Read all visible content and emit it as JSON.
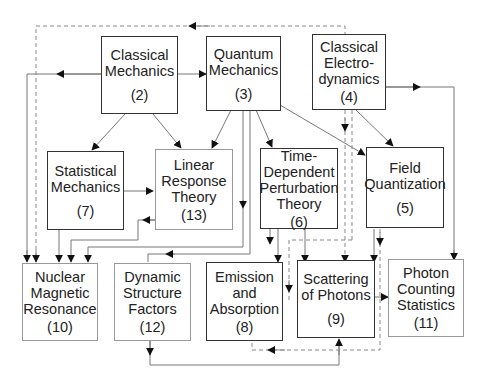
{
  "diagram": {
    "nodes": [
      {
        "id": 2,
        "label": "Classical\nMechanics",
        "number": "(2)"
      },
      {
        "id": 3,
        "label": "Quantum\nMechanics",
        "number": "(3)"
      },
      {
        "id": 4,
        "label": "Classical\nElectro-\ndynamics",
        "number": "(4)"
      },
      {
        "id": 7,
        "label": "Statistical\nMechanics",
        "number": "(7)"
      },
      {
        "id": 13,
        "label": "Linear\nResponse\nTheory",
        "number": "(13)"
      },
      {
        "id": 6,
        "label": "Time-\nDependent\nPerturbation\nTheory",
        "number": "(6)"
      },
      {
        "id": 5,
        "label": "Field\nQuantization",
        "number": "(5)"
      },
      {
        "id": 10,
        "label": "Nuclear\nMagnetic\nResonance",
        "number": "(10)"
      },
      {
        "id": 12,
        "label": "Dynamic\nStructure\nFactors",
        "number": "(12)"
      },
      {
        "id": 8,
        "label": "Emission\nand\nAbsorption",
        "number": "(8)"
      },
      {
        "id": 9,
        "label": "Scattering\nof Photons",
        "number": "(9)"
      },
      {
        "id": 11,
        "label": "Photon\nCounting\nStatistics",
        "number": "(11)"
      }
    ],
    "edges": [
      {
        "from": 2,
        "to": 3,
        "style": "solid"
      },
      {
        "from": 2,
        "to": 10,
        "style": "solid"
      },
      {
        "from": 2,
        "to": 7,
        "style": "solid"
      },
      {
        "from": 2,
        "to": 13,
        "style": "solid"
      },
      {
        "from": 3,
        "to": 13,
        "style": "solid"
      },
      {
        "from": 3,
        "to": 6,
        "style": "solid"
      },
      {
        "from": 3,
        "to": 5,
        "style": "solid"
      },
      {
        "from": 3,
        "to": 10,
        "style": "solid"
      },
      {
        "from": 3,
        "to": 12,
        "style": "solid"
      },
      {
        "from": 4,
        "to": 5,
        "style": "solid"
      },
      {
        "from": 4,
        "to": 11,
        "style": "solid"
      },
      {
        "from": 4,
        "to": 10,
        "style": "dashed"
      },
      {
        "from": 4,
        "to": 9,
        "style": "dashed"
      },
      {
        "from": 7,
        "to": 13,
        "style": "solid"
      },
      {
        "from": 7,
        "to": 10,
        "style": "solid"
      },
      {
        "from": 13,
        "to": 10,
        "style": "solid"
      },
      {
        "from": 6,
        "to": 8,
        "style": "solid"
      },
      {
        "from": 6,
        "to": 9,
        "style": "solid"
      },
      {
        "from": 6,
        "to": 13,
        "style": "solid"
      },
      {
        "from": 5,
        "to": 9,
        "style": "solid"
      },
      {
        "from": 5,
        "to": 8,
        "style": "dashed"
      },
      {
        "from": 9,
        "to": 11,
        "style": "solid"
      },
      {
        "from": 12,
        "to": 9,
        "style": "solid"
      },
      {
        "from": 9,
        "to": 8,
        "style": "dashed"
      }
    ]
  }
}
